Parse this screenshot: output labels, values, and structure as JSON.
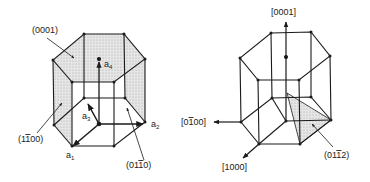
{
  "figure": {
    "left_prism": {
      "plane_labels": {
        "basal": "(0001)",
        "prism_front_left": "(1̄100)",
        "prism_back_right": "(011̄0)"
      },
      "plane_label_parts": {
        "basal": [
          "(0001)"
        ],
        "prism_front_left": [
          "(1",
          "1",
          "00)"
        ],
        "prism_back_right": [
          "(01",
          "1",
          "0)"
        ]
      },
      "axes": [
        {
          "name": "a",
          "sub": "1"
        },
        {
          "name": "a",
          "sub": "2"
        },
        {
          "name": "a",
          "sub": "3"
        },
        {
          "name": "a",
          "sub": "4"
        }
      ]
    },
    "right_prism": {
      "direction_labels": {
        "c_axis": "[0001]",
        "minus_a2": "[01̄ 00]",
        "a1": "[1000]"
      },
      "direction_label_parts": {
        "c_axis": [
          "[0001]"
        ],
        "minus_a2": [
          "[0",
          "1",
          "00]"
        ],
        "a1": [
          "[1000]"
        ]
      },
      "plane_label_parts": {
        "pyramidal": [
          "(01",
          "1",
          "2)"
        ]
      }
    },
    "colors": {
      "line": "#1a1a1a",
      "shade": "#d9d9d9",
      "background": "#ffffff"
    }
  }
}
